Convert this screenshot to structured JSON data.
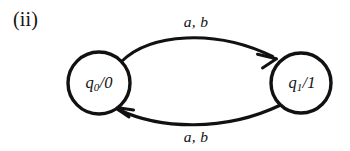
{
  "figure": {
    "label": "(ii)",
    "kind": "finite-state-transducer-diagram",
    "background_color": "#ffffff",
    "ink_color": "#131110"
  },
  "states": [
    {
      "id": "q0",
      "name": "q",
      "subscript": "0",
      "separator": "/",
      "output": "0",
      "full_label": "q0/0",
      "cx": 99,
      "cy": 83,
      "r": 31
    },
    {
      "id": "q1",
      "name": "q",
      "subscript": "1",
      "separator": "/",
      "output": "1",
      "full_label": "q1/1",
      "cx": 301,
      "cy": 83,
      "r": 30
    }
  ],
  "transitions": [
    {
      "id": "t-top",
      "from": "q0",
      "to": "q1",
      "label": "a, b",
      "direction": "right",
      "curve": "arc-above"
    },
    {
      "id": "t-bottom",
      "from": "q1",
      "to": "q0",
      "label": "a, b",
      "direction": "left",
      "curve": "arc-below"
    }
  ]
}
